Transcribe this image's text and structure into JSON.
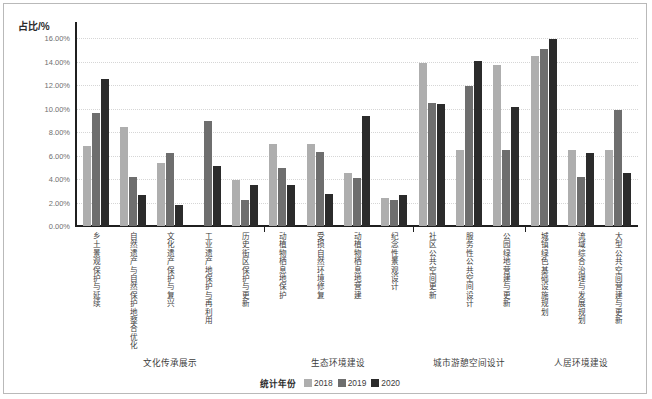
{
  "chart_data": {
    "type": "bar",
    "title": "",
    "ylabel": "占比/%",
    "xlabel": "",
    "ylim": [
      0,
      16
    ],
    "grid": true,
    "legend_position": "bottom",
    "legend_title": "统计年份",
    "y_ticks": [
      "0.00%",
      "2.00%",
      "4.00%",
      "6.00%",
      "8.00%",
      "10.00%",
      "12.00%",
      "14.00%",
      "16.00%"
    ],
    "y_tick_values": [
      0,
      2,
      4,
      6,
      8,
      10,
      12,
      14,
      16
    ],
    "categories": [
      "乡土景观保护与延续",
      "自然遗产与自然保护地整合优化",
      "文化遗产保护与复兴",
      "工业遗产地保护与再利用",
      "历史街区保护与更新",
      "动植物栖息地保护",
      "受损自然环境修复",
      "动植物栖息地营建",
      "纪念性景观设计",
      "社区公共空间更新",
      "服务性公共空间设计",
      "公园绿地营建与更新",
      "城镇绿色基础设施规划",
      "流域综合治理与发展规划",
      "大型公共空间营建与更新"
    ],
    "series": [
      {
        "name": "2018",
        "color": "#aeaeae",
        "values": [
          6.8,
          8.4,
          5.35,
          0.0,
          3.9,
          7.0,
          7.0,
          4.55,
          2.4,
          13.85,
          6.45,
          13.7,
          14.45,
          6.5,
          6.5
        ]
      },
      {
        "name": "2019",
        "color": "#6e6e6e",
        "values": [
          9.6,
          4.15,
          6.2,
          8.95,
          2.2,
          4.9,
          6.3,
          4.05,
          2.25,
          10.5,
          11.9,
          6.45,
          15.05,
          4.2,
          9.85
        ]
      },
      {
        "name": "2020",
        "color": "#2b2b2b",
        "values": [
          12.55,
          2.6,
          1.8,
          5.1,
          3.5,
          3.5,
          2.75,
          9.35,
          2.65,
          10.4,
          14.05,
          10.1,
          15.9,
          6.25,
          4.5
        ]
      }
    ],
    "groups": [
      {
        "label": "文化传承展示",
        "categories": [
          0,
          1,
          2,
          3,
          4
        ]
      },
      {
        "label": "生态环境建设",
        "categories": [
          5,
          6,
          7,
          8
        ]
      },
      {
        "label": "城市游憩空间设计",
        "categories": [
          9,
          10,
          11
        ]
      },
      {
        "label": "人居环境建设",
        "categories": [
          12,
          13,
          14
        ]
      }
    ]
  }
}
